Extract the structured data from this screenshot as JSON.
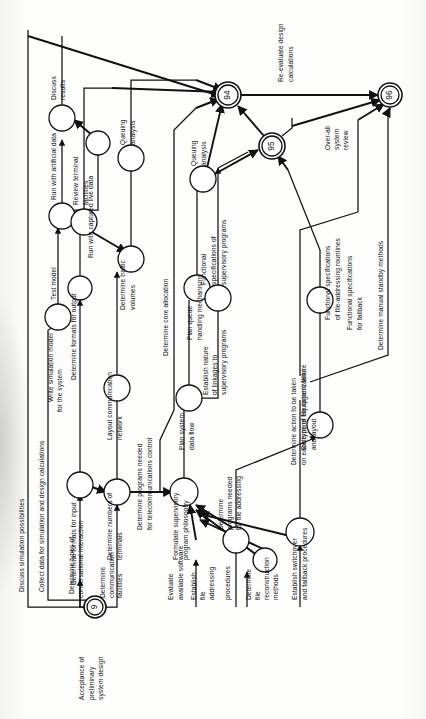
{
  "diagram": {
    "orientation": "rotated-90-ccw",
    "style": {
      "ink": "#111111",
      "paper": "#fdfdfb",
      "node_fill": "#ffffff"
    },
    "milestones": [
      {
        "id": "m9",
        "number": "9",
        "label": "Acceptance of\npreliminary\nsystem design",
        "label_lines": [
          "Acceptance of",
          "preliminary",
          "system design"
        ]
      },
      {
        "id": "m94",
        "number": "94",
        "label": "",
        "label_lines": []
      },
      {
        "id": "m95",
        "number": "95",
        "label": "",
        "label_lines": []
      },
      {
        "id": "m96",
        "number": "96",
        "label": "",
        "label_lines": []
      }
    ],
    "activities": [
      {
        "id": "a1",
        "label_lines": [
          "Discuss",
          "results"
        ]
      },
      {
        "id": "a2",
        "label_lines": [
          "Run  with  artificial data"
        ]
      },
      {
        "id": "a3",
        "label_lines": [
          "Test model"
        ]
      },
      {
        "id": "a4",
        "label_lines": [
          "Run with captured live data"
        ]
      },
      {
        "id": "a5",
        "label_lines": [
          "Write simulation model",
          "for the system"
        ]
      },
      {
        "id": "a6",
        "label_lines": [
          "Discuss simulation possibilities"
        ]
      },
      {
        "id": "a7",
        "label_lines": [
          "Collect data for simulation and design calculations"
        ]
      },
      {
        "id": "a8",
        "label_lines": [
          "Review terminal",
          "facilities"
        ]
      },
      {
        "id": "a9",
        "label_lines": [
          "Determine formats for output"
        ]
      },
      {
        "id": "a10",
        "label_lines": [
          "Determine formats for input"
        ]
      },
      {
        "id": "a11",
        "label_lines": [
          "Determine types of",
          "conversational interaction"
        ]
      },
      {
        "id": "a12",
        "label_lines": [
          "Queuing",
          "analysis"
        ]
      },
      {
        "id": "a13",
        "label_lines": [
          "Determine traffic",
          "volumes"
        ]
      },
      {
        "id": "a14",
        "label_lines": [
          "Layout communication",
          "network"
        ]
      },
      {
        "id": "a15",
        "label_lines": [
          "Determine numbers of",
          "terminals"
        ]
      },
      {
        "id": "a16",
        "label_lines": [
          "Determine",
          "communication",
          "facilities"
        ]
      },
      {
        "id": "a17",
        "label_lines": [
          "Determine programs needed",
          "for telecommunications control"
        ]
      },
      {
        "id": "a18",
        "label_lines": [
          "Determine core allocation"
        ]
      },
      {
        "id": "a19",
        "label_lines": [
          "Queuing",
          "analysis"
        ]
      },
      {
        "id": "a20",
        "label_lines": [
          "Plan queue",
          "handling mechanisms"
        ]
      },
      {
        "id": "a21",
        "label_lines": [
          "Plan system",
          "data flow"
        ]
      },
      {
        "id": "a22",
        "label_lines": [
          "Formulate supervisory",
          "program philosophy"
        ]
      },
      {
        "id": "a23",
        "label_lines": [
          "Evaluate",
          "available software"
        ]
      },
      {
        "id": "a24",
        "label_lines": [
          "Functional",
          "specifications of",
          "supervisory programs"
        ]
      },
      {
        "id": "a25",
        "label_lines": [
          "Establish nature",
          "of linkages to",
          "supervisory programs"
        ]
      },
      {
        "id": "a26",
        "label_lines": [
          "Determine",
          "programs needed",
          "for file addressing"
        ]
      },
      {
        "id": "a27",
        "label_lines": [
          "Establish",
          "file",
          "addressing",
          "procedures"
        ]
      },
      {
        "id": "a28",
        "label_lines": [
          "Determine file organization",
          "and layout"
        ]
      },
      {
        "id": "a29",
        "label_lines": [
          "Determine",
          "file",
          "reconstruction",
          "methods"
        ]
      },
      {
        "id": "a30",
        "label_lines": [
          "Functional specifications",
          "of file-addressing rountines"
        ]
      },
      {
        "id": "a31",
        "label_lines": [
          "Determine action to be taken",
          "on each type of equipment failure"
        ]
      },
      {
        "id": "a32",
        "label_lines": [
          "Establish switchover",
          "and fallback procedures"
        ]
      },
      {
        "id": "a33",
        "label_lines": [
          "Functional specifications",
          "for fallback"
        ]
      },
      {
        "id": "a34",
        "label_lines": [
          "Determine manual  standby methods"
        ]
      },
      {
        "id": "a35",
        "label_lines": [
          "Re-evaluate design",
          "calculations"
        ]
      },
      {
        "id": "a36",
        "label_lines": [
          "Over-all",
          "system",
          "review"
        ]
      }
    ]
  }
}
